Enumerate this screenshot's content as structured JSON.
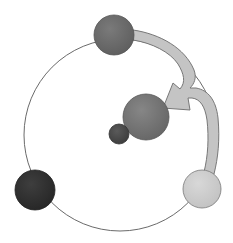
{
  "diagram": {
    "orbit": {
      "stroke": "#6a6a6a",
      "fill": "#ffffff"
    },
    "nodes": [
      {
        "id": "top-node",
        "fill": "#6e6e6e"
      },
      {
        "id": "bottom-left-node",
        "fill": "#353535"
      },
      {
        "id": "bottom-right-node",
        "fill": "#cfcfcf"
      },
      {
        "id": "center-large-node",
        "fill": "#7a7a7a"
      },
      {
        "id": "center-small-node",
        "fill": "#505050"
      }
    ],
    "arrow": {
      "fill": "#c4c4c4",
      "stroke": "#777777"
    }
  }
}
